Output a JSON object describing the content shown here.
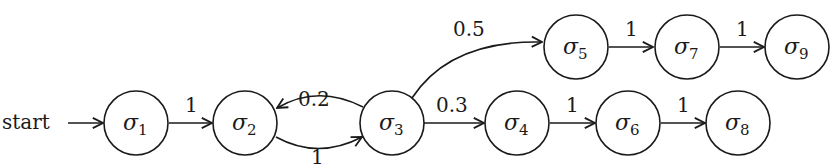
{
  "diagram": {
    "type": "state-transition-graph",
    "start_label": "start",
    "nodes": [
      {
        "id": "s1",
        "symbol": "σ",
        "sub": "1"
      },
      {
        "id": "s2",
        "symbol": "σ",
        "sub": "2"
      },
      {
        "id": "s3",
        "symbol": "σ",
        "sub": "3"
      },
      {
        "id": "s4",
        "symbol": "σ",
        "sub": "4"
      },
      {
        "id": "s5",
        "symbol": "σ",
        "sub": "5"
      },
      {
        "id": "s6",
        "symbol": "σ",
        "sub": "6"
      },
      {
        "id": "s7",
        "symbol": "σ",
        "sub": "7"
      },
      {
        "id": "s8",
        "symbol": "σ",
        "sub": "8"
      },
      {
        "id": "s9",
        "symbol": "σ",
        "sub": "9"
      }
    ],
    "edges": [
      {
        "from": "start",
        "to": "s1",
        "label": ""
      },
      {
        "from": "s1",
        "to": "s2",
        "label": "1"
      },
      {
        "from": "s2",
        "to": "s3",
        "label": "1"
      },
      {
        "from": "s3",
        "to": "s2",
        "label": "0.2"
      },
      {
        "from": "s3",
        "to": "s4",
        "label": "0.3"
      },
      {
        "from": "s3",
        "to": "s5",
        "label": "0.5"
      },
      {
        "from": "s4",
        "to": "s6",
        "label": "1"
      },
      {
        "from": "s6",
        "to": "s8",
        "label": "1"
      },
      {
        "from": "s5",
        "to": "s7",
        "label": "1"
      },
      {
        "from": "s7",
        "to": "s9",
        "label": "1"
      }
    ]
  }
}
